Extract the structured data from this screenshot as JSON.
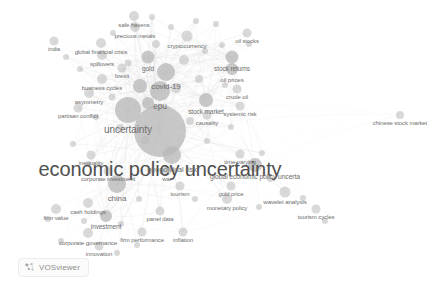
{
  "app": {
    "name": "VOSviewer",
    "watermark_label": "VOSviewer",
    "background_color": "#ffffff",
    "node_color": "#b9b9b9",
    "edge_color": "#dedede",
    "label_color": "#6e6e6e"
  },
  "chart_data": {
    "type": "scatter",
    "title": "",
    "xlabel": "",
    "ylabel": "",
    "grid": false,
    "legend": "none",
    "xlim": [
      0,
      447
    ],
    "ylim": [
      0,
      292
    ],
    "nodes": [
      {
        "label": "economic policy uncertainty",
        "x": 160,
        "y": 131,
        "size": 26,
        "font": 20,
        "weight": 100
      },
      {
        "label": "uncertainty",
        "x": 128,
        "y": 110,
        "size": 13,
        "font": 10,
        "weight": 52
      },
      {
        "label": "epu",
        "x": 160,
        "y": 91,
        "size": 10,
        "font": 8.5,
        "weight": 38
      },
      {
        "label": "covid-19",
        "x": 166,
        "y": 72,
        "size": 9,
        "font": 8,
        "weight": 34
      },
      {
        "label": "geopolitical risk",
        "x": 172,
        "y": 155,
        "size": 9,
        "font": 7.5,
        "weight": 33
      },
      {
        "label": "china",
        "x": 117,
        "y": 184,
        "size": 9,
        "font": 8,
        "weight": 32
      },
      {
        "label": "stock market",
        "x": 206,
        "y": 100,
        "size": 7,
        "font": 6.5,
        "weight": 26
      },
      {
        "label": "global economic policy uncerta",
        "x": 255,
        "y": 165,
        "size": 7,
        "font": 6.8,
        "weight": 25
      },
      {
        "label": "gold",
        "x": 148,
        "y": 57,
        "size": 6.5,
        "font": 6.5,
        "weight": 23
      },
      {
        "label": "stock returns",
        "x": 232,
        "y": 57,
        "size": 6.5,
        "font": 6.5,
        "weight": 22
      },
      {
        "label": "oil prices",
        "x": 232,
        "y": 69,
        "size": 6,
        "font": 6.2,
        "weight": 21
      },
      {
        "label": "investment",
        "x": 106,
        "y": 216,
        "size": 6,
        "font": 6.5,
        "weight": 21
      },
      {
        "label": "cryptocurrency",
        "x": 187,
        "y": 36,
        "size": 5.5,
        "font": 6.2,
        "weight": 19
      },
      {
        "label": "wavelet analysis",
        "x": 285,
        "y": 192,
        "size": 5.5,
        "font": 6.2,
        "weight": 19
      },
      {
        "label": "corporate governance",
        "x": 88,
        "y": 233,
        "size": 5,
        "font": 6.2,
        "weight": 17
      },
      {
        "label": "business cycles",
        "x": 102,
        "y": 79,
        "size": 5,
        "font": 6,
        "weight": 17
      },
      {
        "label": "global financial crisis",
        "x": 101,
        "y": 43,
        "size": 5,
        "font": 6,
        "weight": 17
      },
      {
        "label": "asymmetry",
        "x": 89,
        "y": 93,
        "size": 5,
        "font": 6,
        "weight": 16
      },
      {
        "label": "firm value",
        "x": 56,
        "y": 209,
        "size": 5,
        "font": 6,
        "weight": 16
      },
      {
        "label": "cash holdings",
        "x": 88,
        "y": 203,
        "size": 5,
        "font": 6,
        "weight": 16
      },
      {
        "label": "monetary policy",
        "x": 227,
        "y": 199,
        "size": 5,
        "font": 6,
        "weight": 16
      },
      {
        "label": "precious metals",
        "x": 135,
        "y": 27,
        "size": 5,
        "font": 6,
        "weight": 15
      },
      {
        "label": "safe havens",
        "x": 134,
        "y": 16,
        "size": 5,
        "font": 6,
        "weight": 15
      },
      {
        "label": "spillovers",
        "x": 102,
        "y": 55,
        "size": 5,
        "font": 6,
        "weight": 15
      },
      {
        "label": "partisan conflict",
        "x": 78,
        "y": 108,
        "size": 4.5,
        "font": 6,
        "weight": 14
      },
      {
        "label": "firm performance",
        "x": 142,
        "y": 232,
        "size": 4.5,
        "font": 6,
        "weight": 14
      },
      {
        "label": "inflation",
        "x": 183,
        "y": 232,
        "size": 4.5,
        "font": 6,
        "weight": 14
      },
      {
        "label": "panel data",
        "x": 160,
        "y": 211,
        "size": 4.5,
        "font": 6,
        "weight": 14
      },
      {
        "label": "corporate investment",
        "x": 108,
        "y": 171,
        "size": 4.5,
        "font": 6,
        "weight": 13
      },
      {
        "label": "tourism",
        "x": 180,
        "y": 186,
        "size": 4.5,
        "font": 6,
        "weight": 13
      },
      {
        "label": "gold price",
        "x": 231,
        "y": 186,
        "size": 4.5,
        "font": 6,
        "weight": 13
      },
      {
        "label": "time-varying",
        "x": 240,
        "y": 154,
        "size": 4.5,
        "font": 6,
        "weight": 13
      },
      {
        "label": "causality",
        "x": 207,
        "y": 115,
        "size": 4.5,
        "font": 6,
        "weight": 13
      },
      {
        "label": "systemic risk",
        "x": 240,
        "y": 106,
        "size": 4.5,
        "font": 6,
        "weight": 13
      },
      {
        "label": "crude oil",
        "x": 237,
        "y": 89,
        "size": 4.5,
        "font": 6,
        "weight": 12
      },
      {
        "label": "oil stocks",
        "x": 247,
        "y": 33,
        "size": 4.5,
        "font": 6,
        "weight": 12
      },
      {
        "label": "brexit",
        "x": 122,
        "y": 68,
        "size": 4.5,
        "font": 6,
        "weight": 12
      },
      {
        "label": "india",
        "x": 54,
        "y": 41,
        "size": 4.5,
        "font": 6,
        "weight": 12
      },
      {
        "label": "inequality",
        "x": 91,
        "y": 155,
        "size": 4.5,
        "font": 6,
        "weight": 12
      },
      {
        "label": "war",
        "x": 167,
        "y": 171,
        "size": 4.5,
        "font": 6,
        "weight": 12
      },
      {
        "label": "innovation",
        "x": 99,
        "y": 246,
        "size": 4.5,
        "font": 6,
        "weight": 12
      },
      {
        "label": "tourism cycles",
        "x": 316,
        "y": 209,
        "size": 4.5,
        "font": 6,
        "weight": 12
      },
      {
        "label": "chinese stock market",
        "x": 400,
        "y": 115,
        "size": 4,
        "font": 6,
        "weight": 10
      }
    ],
    "unlabeled_nodes": [
      {
        "x": 140,
        "y": 86,
        "size": 7
      },
      {
        "x": 148,
        "y": 103,
        "size": 6
      },
      {
        "x": 176,
        "y": 88,
        "size": 5
      },
      {
        "x": 184,
        "y": 60,
        "size": 5
      },
      {
        "x": 156,
        "y": 44,
        "size": 4
      },
      {
        "x": 199,
        "y": 79,
        "size": 4
      },
      {
        "x": 190,
        "y": 121,
        "size": 4
      },
      {
        "x": 145,
        "y": 140,
        "size": 4
      },
      {
        "x": 120,
        "y": 128,
        "size": 4
      },
      {
        "x": 112,
        "y": 97,
        "size": 3.5
      },
      {
        "x": 128,
        "y": 63,
        "size": 3.5
      },
      {
        "x": 171,
        "y": 27,
        "size": 3
      },
      {
        "x": 216,
        "y": 24,
        "size": 3
      },
      {
        "x": 222,
        "y": 45,
        "size": 3
      },
      {
        "x": 205,
        "y": 51,
        "size": 3
      },
      {
        "x": 249,
        "y": 44,
        "size": 3
      },
      {
        "x": 225,
        "y": 85,
        "size": 3
      },
      {
        "x": 231,
        "y": 127,
        "size": 3
      },
      {
        "x": 207,
        "y": 141,
        "size": 3
      },
      {
        "x": 262,
        "y": 153,
        "size": 3
      },
      {
        "x": 270,
        "y": 179,
        "size": 3
      },
      {
        "x": 259,
        "y": 207,
        "size": 3
      },
      {
        "x": 303,
        "y": 198,
        "size": 3
      },
      {
        "x": 325,
        "y": 221,
        "size": 3
      },
      {
        "x": 195,
        "y": 199,
        "size": 3
      },
      {
        "x": 139,
        "y": 199,
        "size": 3
      },
      {
        "x": 121,
        "y": 224,
        "size": 3
      },
      {
        "x": 84,
        "y": 221,
        "size": 3
      },
      {
        "x": 48,
        "y": 219,
        "size": 3
      },
      {
        "x": 61,
        "y": 241,
        "size": 3
      },
      {
        "x": 117,
        "y": 253,
        "size": 3
      },
      {
        "x": 137,
        "y": 245,
        "size": 3
      },
      {
        "x": 88,
        "y": 164,
        "size": 3
      },
      {
        "x": 73,
        "y": 144,
        "size": 3
      },
      {
        "x": 96,
        "y": 117,
        "size": 3
      },
      {
        "x": 80,
        "y": 69,
        "size": 3
      },
      {
        "x": 66,
        "y": 57,
        "size": 3
      },
      {
        "x": 113,
        "y": 33,
        "size": 3
      },
      {
        "x": 152,
        "y": 17,
        "size": 3
      },
      {
        "x": 196,
        "y": 21,
        "size": 3
      }
    ]
  }
}
